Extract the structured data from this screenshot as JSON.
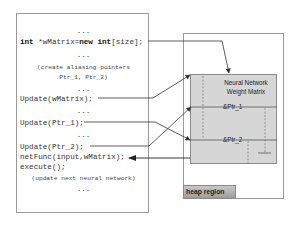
{
  "code_panel": {
    "lines": [
      {
        "text": "...",
        "style": "ellipsis"
      },
      {
        "keyword1": "int",
        "mid": " *wMatrix=",
        "keyword2": "new",
        "sp": " ",
        "keyword3": "int",
        "rest": "[size];"
      },
      {
        "text": "...",
        "style": "ellipsis"
      },
      {
        "text": "(create aliasing pointers",
        "style": "comment"
      },
      {
        "text": "Ptr_1, Ptr_2)",
        "style": "comment"
      },
      {
        "text": "...",
        "style": "ellipsis"
      },
      {
        "text": "Update(wMatrix);"
      },
      {
        "text": "...",
        "style": "ellipsis"
      },
      {
        "text": "Update(Ptr_1);"
      },
      {
        "text": "...",
        "style": "ellipsis"
      },
      {
        "text": "Update(Ptr_2);"
      },
      {
        "text": "netFunc(input,wMatrix);"
      },
      {
        "text": "execute();"
      },
      {
        "text": "(update next neural network)",
        "style": "comment"
      },
      {
        "text": "...",
        "style": "ellipsis"
      }
    ]
  },
  "heap_panel": {
    "matrix_title_line1": "Neural Network",
    "matrix_title_line2": "Weight Matrix",
    "ptr1_label": "&Ptr_1",
    "ptr2_label": "&Ptr_2",
    "region_label": "heap region"
  },
  "colors": {
    "matrix_fill": "#d6d6d6",
    "border": "#9a9a9a",
    "line": "#333333"
  }
}
